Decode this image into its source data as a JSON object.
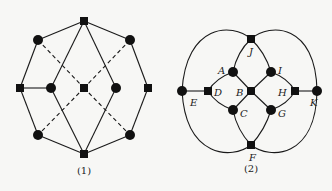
{
  "figures": [
    {
      "caption": "(1)",
      "caption_pos": [
        84,
        174
      ],
      "nodes": [
        {
          "id": "t",
          "shape": "square",
          "x": 84,
          "y": 21
        },
        {
          "id": "ul",
          "shape": "circle",
          "x": 38,
          "y": 40
        },
        {
          "id": "ur",
          "shape": "circle",
          "x": 130,
          "y": 40
        },
        {
          "id": "l",
          "shape": "square",
          "x": 20,
          "y": 88
        },
        {
          "id": "il",
          "shape": "circle",
          "x": 51,
          "y": 88
        },
        {
          "id": "c",
          "shape": "square",
          "x": 84,
          "y": 88
        },
        {
          "id": "ir",
          "shape": "circle",
          "x": 116,
          "y": 88
        },
        {
          "id": "r",
          "shape": "square",
          "x": 148,
          "y": 88
        },
        {
          "id": "ll",
          "shape": "circle",
          "x": 38,
          "y": 135
        },
        {
          "id": "lr",
          "shape": "circle",
          "x": 130,
          "y": 135
        },
        {
          "id": "b",
          "shape": "square",
          "x": 84,
          "y": 154
        }
      ],
      "edges": [
        [
          "t",
          "ul"
        ],
        [
          "ul",
          "l"
        ],
        [
          "l",
          "ll"
        ],
        [
          "ll",
          "b"
        ],
        [
          "b",
          "lr"
        ],
        [
          "lr",
          "r"
        ],
        [
          "r",
          "ur"
        ],
        [
          "ur",
          "t"
        ],
        [
          "l",
          "il"
        ],
        [
          "t",
          "il"
        ],
        [
          "il",
          "b"
        ],
        [
          "t",
          "ir"
        ],
        [
          "ir",
          "b"
        ]
      ],
      "dashed_edges": [
        [
          "ul",
          "c"
        ],
        [
          "c",
          "lr"
        ],
        [
          "ur",
          "c"
        ],
        [
          "c",
          "ll"
        ]
      ]
    },
    {
      "caption": "(2)",
      "caption_pos": [
        251,
        172
      ],
      "nodes": [
        {
          "id": "J",
          "shape": "square",
          "x": 251,
          "y": 39,
          "label": "J",
          "lx": 249,
          "ly": 55
        },
        {
          "id": "A",
          "shape": "circle",
          "x": 233,
          "y": 72,
          "label": "A",
          "lx": 218,
          "ly": 74
        },
        {
          "id": "I",
          "shape": "circle",
          "x": 271,
          "y": 72,
          "label": "I",
          "lx": 278,
          "ly": 74
        },
        {
          "id": "E",
          "shape": "circle",
          "x": 182,
          "y": 91,
          "label": "E",
          "lx": 190,
          "ly": 106
        },
        {
          "id": "D",
          "shape": "square",
          "x": 208,
          "y": 91,
          "label": "D",
          "lx": 214,
          "ly": 96
        },
        {
          "id": "B",
          "shape": "square",
          "x": 251,
          "y": 91,
          "label": "B",
          "lx": 236,
          "ly": 96
        },
        {
          "id": "H",
          "shape": "square",
          "x": 295,
          "y": 91,
          "label": "H",
          "lx": 278,
          "ly": 96
        },
        {
          "id": "K",
          "shape": "circle",
          "x": 317,
          "y": 91,
          "label": "K",
          "lx": 310,
          "ly": 106
        },
        {
          "id": "C",
          "shape": "circle",
          "x": 233,
          "y": 110,
          "label": "C",
          "lx": 240,
          "ly": 117
        },
        {
          "id": "G",
          "shape": "circle",
          "x": 271,
          "y": 110,
          "label": "G",
          "lx": 278,
          "ly": 117
        },
        {
          "id": "F",
          "shape": "square",
          "x": 251,
          "y": 145,
          "label": "F",
          "lx": 249,
          "ly": 161
        }
      ],
      "edges": [
        [
          "E",
          "D"
        ],
        [
          "H",
          "K"
        ],
        [
          "A",
          "B"
        ],
        [
          "B",
          "I"
        ],
        [
          "B",
          "C"
        ],
        [
          "B",
          "G"
        ]
      ],
      "curves": [
        "M251,39 Q237,52 233,72",
        "M251,39 Q265,52 271,72",
        "M233,72 Q216,78 208,91",
        "M208,91 Q216,104 233,110",
        "M271,72 Q288,78 295,91",
        "M295,91 Q288,104 271,110",
        "M233,110 Q237,130 251,145",
        "M271,110 Q265,130 251,145",
        "M251,39 C232,22 186,24 182,91",
        "M182,91 C186,158 232,160 251,145",
        "M251,39 C270,22 316,24 317,91",
        "M317,91 C316,158 270,160 251,145"
      ]
    }
  ]
}
